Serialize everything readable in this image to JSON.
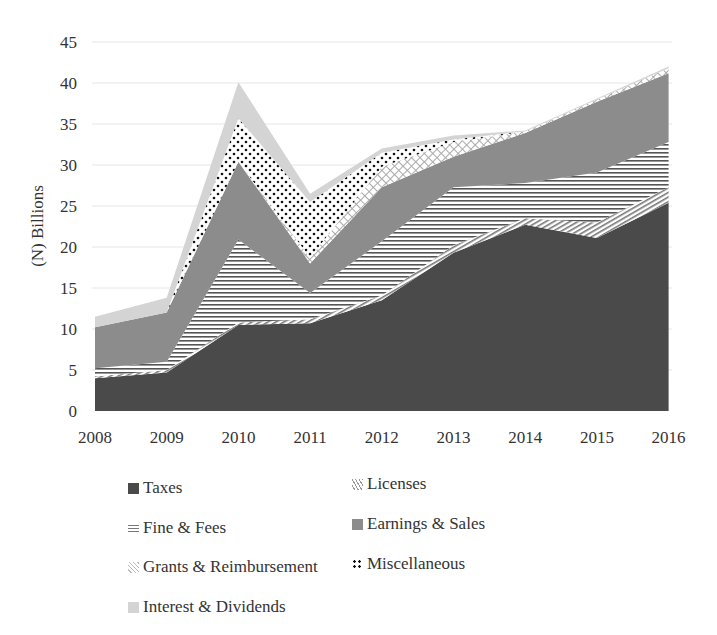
{
  "chart_data": {
    "type": "area",
    "stacked": true,
    "title": "",
    "xlabel": "",
    "ylabel": "(N) Billions",
    "ylim": [
      0,
      45
    ],
    "yticks": [
      0,
      5,
      10,
      15,
      20,
      25,
      30,
      35,
      40,
      45
    ],
    "grid": true,
    "legend_position": "bottom",
    "categories": [
      "2008",
      "2009",
      "2010",
      "2011",
      "2012",
      "2013",
      "2014",
      "2015",
      "2016"
    ],
    "series": [
      {
        "name": "Taxes",
        "pattern": "solid-dark",
        "color": "#4a4a4a",
        "values": [
          4.0,
          4.7,
          10.5,
          10.7,
          13.5,
          19.3,
          22.7,
          21.1,
          25.4
        ]
      },
      {
        "name": "Licenses",
        "pattern": "diagonal-lines",
        "color": "#9a9a9a",
        "values": [
          0.2,
          0.3,
          0.3,
          0.5,
          0.6,
          0.9,
          0.8,
          1.9,
          1.9
        ]
      },
      {
        "name": "Fine & Fees",
        "pattern": "horizontal-lines",
        "color": "#555555",
        "values": [
          1.0,
          1.0,
          10.1,
          3.2,
          6.6,
          7.1,
          4.3,
          6.1,
          5.5
        ]
      },
      {
        "name": "Earnings & Sales",
        "pattern": "solid-mid",
        "color": "#8c8c8c",
        "values": [
          5.0,
          6.0,
          9.5,
          3.6,
          6.6,
          3.7,
          6.1,
          8.6,
          8.4
        ]
      },
      {
        "name": "Grants & Reimbursement",
        "pattern": "crosshatch",
        "color": "#bdbdbd",
        "values": [
          0.0,
          0.0,
          0.0,
          0.7,
          2.5,
          1.8,
          0.2,
          0.3,
          0.6
        ]
      },
      {
        "name": "Miscellaneous",
        "pattern": "dots",
        "color": "#111111",
        "values": [
          0.0,
          0.0,
          5.3,
          6.8,
          1.7,
          0.3,
          0.0,
          0.0,
          0.0
        ]
      },
      {
        "name": "Interest & Dividends",
        "pattern": "solid-light",
        "color": "#d4d4d4",
        "values": [
          1.3,
          1.8,
          4.4,
          1.0,
          0.5,
          0.5,
          0.1,
          0.1,
          0.2
        ]
      }
    ]
  },
  "legend": {
    "items": [
      {
        "label": "Taxes"
      },
      {
        "label": "Licenses"
      },
      {
        "label": "Fine & Fees"
      },
      {
        "label": "Earnings & Sales"
      },
      {
        "label": "Grants & Reimbursement"
      },
      {
        "label": "Miscellaneous"
      },
      {
        "label": "Interest & Dividends"
      }
    ]
  }
}
